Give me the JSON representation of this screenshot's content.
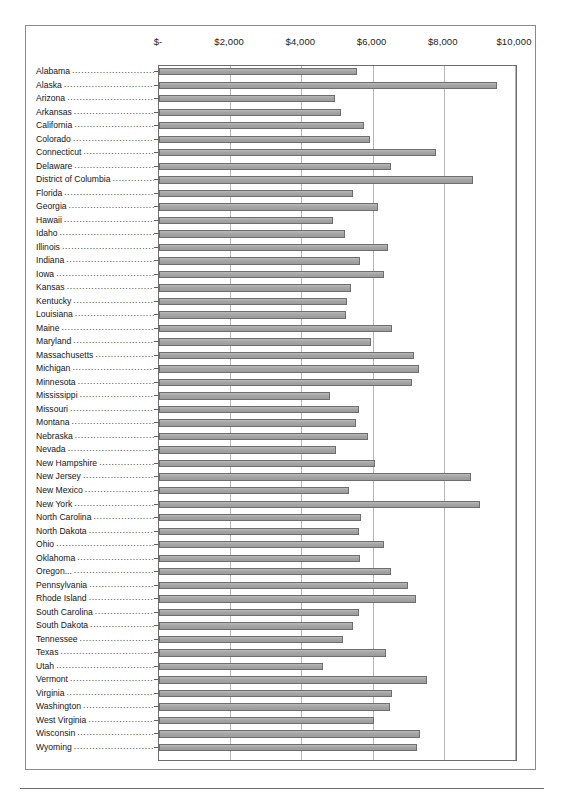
{
  "chart_data": {
    "type": "bar",
    "orientation": "horizontal",
    "title": "",
    "xlabel": "",
    "ylabel": "",
    "xlim": [
      0,
      10000
    ],
    "grid": true,
    "legend": null,
    "axis_tick_labels": [
      "$-",
      "$2,000",
      "$4,000",
      "$6,000",
      "$8,000",
      "$10,000"
    ],
    "axis_tick_values": [
      0,
      2000,
      4000,
      6000,
      8000,
      10000
    ],
    "categories": [
      "Alabama",
      "Alaska",
      "Arizona",
      "Arkansas",
      "California",
      "Colorado",
      "Connecticut",
      "Delaware",
      "District of Columbia",
      "Florida",
      "Georgia",
      "Hawaii",
      "Idaho",
      "Illinois",
      "Indiana",
      "Iowa",
      "Kansas",
      "Kentucky",
      "Louisiana",
      "Maine",
      "Maryland",
      "Massachusetts",
      "Michigan",
      "Minnesota",
      "Mississippi",
      "Missouri",
      "Montana",
      "Nebraska",
      "Nevada",
      "New Hampshire",
      "New Jersey",
      "New Mexico",
      "New York",
      "North Carolina",
      "North Dakota",
      "Ohio",
      "Oklahoma",
      "Oregon...",
      "Pennsylvania",
      "Rhode Island",
      "South Carolina",
      "South Dakota",
      "Tennessee",
      "Texas",
      "Utah",
      "Vermont",
      "Virginia",
      "Washington",
      "West Virginia",
      "Wisconsin",
      "Wyoming"
    ],
    "values": [
      5560,
      9500,
      4950,
      5120,
      5760,
      5930,
      7780,
      6520,
      8830,
      5450,
      6140,
      4880,
      5230,
      6420,
      5650,
      6330,
      5400,
      5290,
      5240,
      6540,
      5960,
      7170,
      7310,
      7100,
      4800,
      5620,
      5520,
      5880,
      4980,
      6060,
      8760,
      5350,
      9030,
      5670,
      5610,
      6310,
      5640,
      6520,
      7000,
      7210,
      5620,
      5460,
      5170,
      6380,
      4620,
      7530,
      6540,
      6500,
      6050,
      7320,
      7260
    ]
  },
  "caption": {
    "text": ""
  },
  "colors": {
    "bar_fill": "#a5a5a5",
    "bar_stroke": "#6e6e6e",
    "gridline": "#b5b5b5",
    "axis": "#6d6d6d",
    "frame": "#8a8a8a",
    "text": "#15151a"
  }
}
